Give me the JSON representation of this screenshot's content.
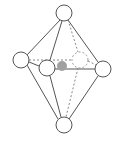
{
  "diagram": {
    "type": "octahedral-molecular-geometry",
    "colors": {
      "background": "#ffffff",
      "line": "#555555",
      "dashed_line": "#888888",
      "central_atom": "#a0a0a0",
      "ligand_fill": "#ffffff"
    },
    "central_atom": {
      "x": 62,
      "y": 66,
      "r": 5
    },
    "ligands": [
      {
        "id": "top",
        "x": 64,
        "y": 13,
        "r": 8,
        "hidden": false
      },
      {
        "id": "left",
        "x": 21,
        "y": 60,
        "r": 8,
        "hidden": false
      },
      {
        "id": "front",
        "x": 47,
        "y": 68,
        "r": 8,
        "hidden": false
      },
      {
        "id": "back",
        "x": 80,
        "y": 60,
        "r": 8,
        "hidden": true
      },
      {
        "id": "right",
        "x": 103,
        "y": 69,
        "r": 8,
        "hidden": false
      },
      {
        "id": "bottom",
        "x": 64,
        "y": 125,
        "r": 8,
        "hidden": false
      }
    ]
  }
}
